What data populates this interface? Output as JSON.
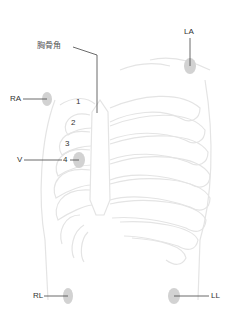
{
  "diagram": {
    "sternal_angle_label": "胸骨角",
    "electrodes": {
      "RA": "RA",
      "LA": "LA",
      "RL": "RL",
      "LL": "LL",
      "V": "V"
    },
    "intercostal_spaces": [
      "1",
      "2",
      "3",
      "4"
    ],
    "colors": {
      "electrode_fill": "#d4d4d4",
      "leader_line": "#444444",
      "ribcage_outline": "#e6e6e6",
      "label_text": "#333333"
    }
  }
}
